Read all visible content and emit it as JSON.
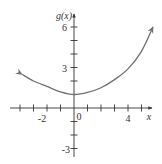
{
  "chart_data": {
    "type": "line",
    "title": "",
    "xlabel": "x",
    "ylabel": "g(x)",
    "xlim": [
      -4,
      6
    ],
    "ylim": [
      -3,
      6
    ],
    "grid": false,
    "legend": null,
    "x_ticks": [
      -4,
      -3,
      -2,
      -1,
      0,
      1,
      2,
      3,
      4,
      5
    ],
    "x_tick_labels": [
      {
        "value": -2,
        "label": "-2"
      },
      {
        "value": 0,
        "label": "0"
      },
      {
        "value": 4,
        "label": "4"
      }
    ],
    "y_ticks": [
      -3,
      -2,
      -1,
      1,
      2,
      3,
      4,
      5,
      6
    ],
    "y_tick_labels": [
      {
        "value": 6,
        "label": "6"
      },
      {
        "value": 3,
        "label": "3"
      },
      {
        "value": -3,
        "label": "-3"
      }
    ],
    "series": [
      {
        "name": "g(x)",
        "color": "#707070",
        "arrows_both_ends": true,
        "x": [
          -3.85,
          -3,
          -2,
          -1,
          0,
          1,
          2,
          3,
          4,
          5,
          5.85
        ],
        "y": [
          2.5,
          2.0,
          1.6,
          1.2,
          1.0,
          1.15,
          1.5,
          2.1,
          2.9,
          4.2,
          6.0
        ]
      }
    ]
  },
  "labels": {
    "x_axis": "x",
    "y_axis": "g(x)",
    "x_neg2": "-2",
    "x_0": "0",
    "x_4": "4",
    "y_6": "6",
    "y_3": "3",
    "y_neg3": "-3"
  }
}
